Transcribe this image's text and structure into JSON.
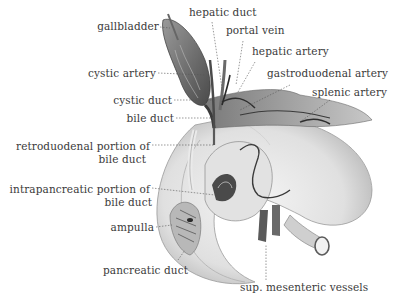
{
  "figure": {
    "labels": {
      "gallbladder": "gallbladder",
      "hepatic_duct": "hepatic duct",
      "portal_vein": "portal vein",
      "hepatic_artery": "hepatic artery",
      "cystic_artery": "cystic artery",
      "gastroduodenal_artery": "gastroduodenal artery",
      "splenic_artery": "splenic artery",
      "cystic_duct": "cystic duct",
      "bile_duct": "bile duct",
      "retroduodenal_1": "retroduodenal portion of",
      "retroduodenal_2": "bile duct",
      "intrapancreatic_1": "intrapancreatic portion of",
      "intrapancreatic_2": "bile duct",
      "ampulla": "ampulla",
      "pancreatic_duct": "pancreatic duct",
      "sup_mesenteric": "sup. mesenteric vessels"
    },
    "colors": {
      "text": "#3a3a3a",
      "leader": "#555555",
      "organ_dark": "#5a5a5a",
      "organ_mid": "#8c8c8c",
      "organ_light": "#d6d6d6",
      "duodenum": "#e4e4e4"
    }
  }
}
